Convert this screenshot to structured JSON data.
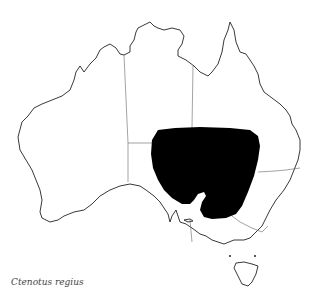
{
  "map": {
    "region": "Australia",
    "caption": "Ctenotus regius",
    "colors": {
      "background": "#ffffff",
      "coastline": "#222222",
      "borders": "#666666",
      "distribution": "#000000"
    }
  }
}
